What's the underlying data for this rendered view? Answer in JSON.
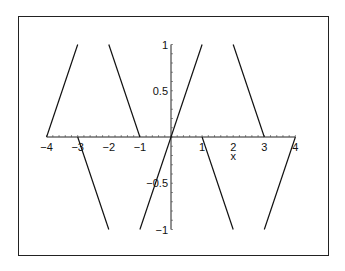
{
  "chart_data": {
    "type": "line",
    "title": "",
    "xlabel": "x",
    "ylabel": "",
    "xlim": [
      -4,
      4
    ],
    "ylim": [
      -1,
      1
    ],
    "grid": false,
    "legend": null,
    "x_ticks": [
      "-4",
      "-3",
      "-2",
      "-1",
      "1",
      "2",
      "3",
      "4"
    ],
    "y_ticks": [
      "1",
      "0.5",
      "-0.5",
      "-1"
    ],
    "series": [
      {
        "name": "f(x)",
        "color": "#111111",
        "segments": [
          [
            [
              -4,
              0
            ],
            [
              -3,
              1
            ]
          ],
          [
            [
              -3,
              0
            ],
            [
              -2,
              -1
            ]
          ],
          [
            [
              -2,
              1
            ],
            [
              -1,
              0
            ]
          ],
          [
            [
              -1,
              -1
            ],
            [
              1,
              1
            ]
          ],
          [
            [
              1,
              0
            ],
            [
              2,
              -1
            ]
          ],
          [
            [
              2,
              1
            ],
            [
              3,
              0
            ]
          ],
          [
            [
              3,
              -1
            ],
            [
              4,
              0
            ]
          ]
        ]
      }
    ]
  }
}
